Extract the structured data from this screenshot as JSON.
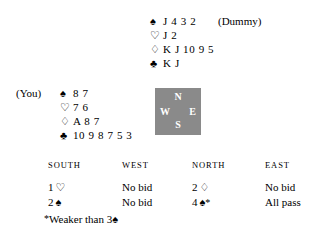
{
  "suits": {
    "spade": "♠",
    "heart": "♡",
    "diamond": "♢",
    "club": "♣"
  },
  "dummy": {
    "label": "(Dummy)",
    "rows": [
      {
        "suit_name": "spade-icon",
        "symbol": "♠",
        "cards": "J 4 3 2"
      },
      {
        "suit_name": "heart-icon",
        "symbol": "♡",
        "cards": "J 2"
      },
      {
        "suit_name": "diamond-icon",
        "symbol": "♢",
        "cards": "K J 10 9 5"
      },
      {
        "suit_name": "club-icon",
        "symbol": "♣",
        "cards": "K J"
      }
    ]
  },
  "you": {
    "label": "(You)",
    "rows": [
      {
        "suit_name": "spade-icon",
        "symbol": "♠",
        "cards": "8 7"
      },
      {
        "suit_name": "heart-icon",
        "symbol": "♡",
        "cards": "7 6"
      },
      {
        "suit_name": "diamond-icon",
        "symbol": "♢",
        "cards": "A 8 7"
      },
      {
        "suit_name": "club-icon",
        "symbol": "♣",
        "cards": "10 9 8 7 5 3"
      }
    ]
  },
  "compass": {
    "north": "N",
    "south": "S",
    "west": "W",
    "east": "E",
    "background_color": "#8a8a8a",
    "text_color": "#ffffff"
  },
  "bidding": {
    "headers": [
      "SOUTH",
      "WEST",
      "NORTH",
      "EAST"
    ],
    "rows": [
      {
        "south": {
          "level": "1",
          "suit": "♡",
          "star": "",
          "text": ""
        },
        "west": {
          "level": "",
          "suit": "",
          "star": "",
          "text": "No bid"
        },
        "north": {
          "level": "2",
          "suit": "♢",
          "star": "",
          "text": ""
        },
        "east": {
          "level": "",
          "suit": "",
          "star": "",
          "text": "No bid"
        }
      },
      {
        "south": {
          "level": "2",
          "suit": "♠",
          "star": "",
          "text": ""
        },
        "west": {
          "level": "",
          "suit": "",
          "star": "",
          "text": "No bid"
        },
        "north": {
          "level": "4",
          "suit": "♠",
          "star": "*",
          "text": ""
        },
        "east": {
          "level": "",
          "suit": "",
          "star": "",
          "text": "All pass"
        }
      }
    ]
  },
  "footnote": {
    "star": "*",
    "text": "Weaker than 3",
    "suit": "♠"
  }
}
